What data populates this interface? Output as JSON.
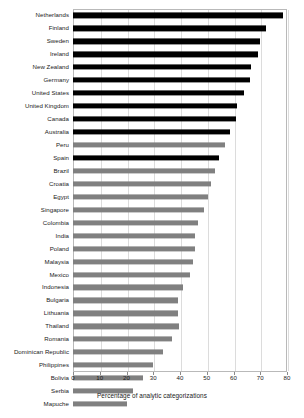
{
  "chart_data": {
    "type": "bar",
    "orientation": "horizontal",
    "title": "",
    "xlabel": "Percentage of analytic categorizations",
    "ylabel": "",
    "xlim": [
      0,
      80
    ],
    "ylim": null,
    "xticks": [
      0,
      10,
      20,
      30,
      40,
      50,
      60,
      70,
      80
    ],
    "xtick_labels": [
      "0",
      "10",
      "20",
      "30",
      "40",
      "50",
      "60",
      "70",
      "80"
    ],
    "grid": "vertical",
    "legend": "none",
    "categories": [
      "Netherlands",
      "Finland",
      "Sweden",
      "Ireland",
      "New Zealand",
      "Germany",
      "United States",
      "United Kingdom",
      "Canada",
      "Australia",
      "Peru",
      "Spain",
      "Brazil",
      "Croatia",
      "Egypt",
      "Singapore",
      "Colombia",
      "India",
      "Poland",
      "Malaysia",
      "Mexico",
      "Indonesia",
      "Bulgaria",
      "Lithuania",
      "Thailand",
      "Romania",
      "Dominican Republic",
      "Philippines",
      "Bolivia",
      "Serbia",
      "Mapuche"
    ],
    "values": [
      78.6,
      72.0,
      70.0,
      69.2,
      66.6,
      66.3,
      63.8,
      61.3,
      60.9,
      58.8,
      57.0,
      54.7,
      53.0,
      51.5,
      50.4,
      48.8,
      46.7,
      45.7,
      45.7,
      45.0,
      43.8,
      41.3,
      39.2,
      39.4,
      39.8,
      36.9,
      33.8,
      29.9,
      26.1,
      22.6,
      20.0
    ],
    "bar_colors": [
      "#000000",
      "#000000",
      "#000000",
      "#000000",
      "#000000",
      "#000000",
      "#000000",
      "#000000",
      "#000000",
      "#000000",
      "#808080",
      "#000000",
      "#808080",
      "#808080",
      "#808080",
      "#808080",
      "#808080",
      "#808080",
      "#808080",
      "#808080",
      "#808080",
      "#808080",
      "#808080",
      "#808080",
      "#808080",
      "#808080",
      "#808080",
      "#808080",
      "#808080",
      "#808080",
      "#808080"
    ],
    "colors": {
      "dark_bar": "#000000",
      "light_bar": "#808080",
      "gridline": "#dcdcdc",
      "axis": "#b9b9b9",
      "text": "#1a1a1a",
      "background": "#ffffff"
    }
  }
}
